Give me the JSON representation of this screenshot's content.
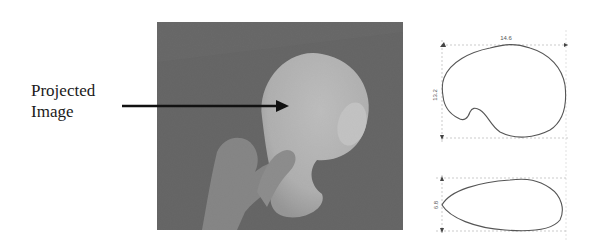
{
  "figure": {
    "label_line1": "Projected",
    "label_line2": "Image",
    "photo_description": "hand holding foam object with projected image",
    "diagram": {
      "top_view": {
        "width_label": "14.6",
        "height_label": "13.2"
      },
      "side_view": {
        "thickness_label": "6.8"
      }
    },
    "colors": {
      "background": "#ffffff",
      "photo_bg": "#5e5e5e",
      "object": "#d8d8d8",
      "arrow": "#111111",
      "outline": "#555555"
    }
  }
}
